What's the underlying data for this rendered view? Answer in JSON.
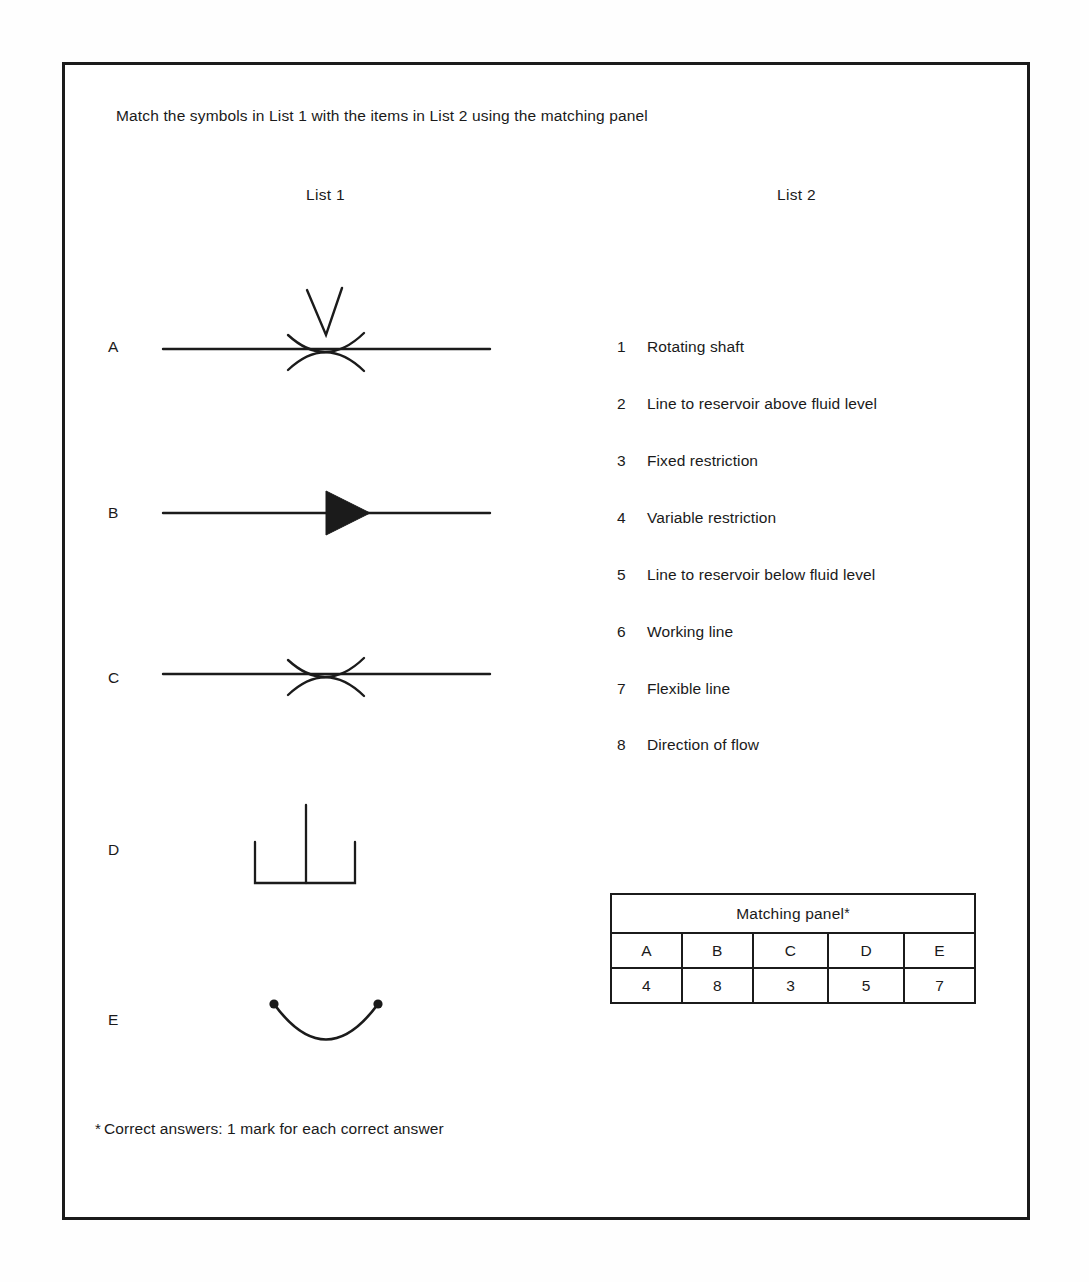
{
  "page": {
    "instruction": "Match the symbols in List 1 with the items in List 2 using the matching panel",
    "footnote_marker": "*",
    "footnote": "Correct answers: 1 mark for each correct answer",
    "ink_color": "#1b1b1b",
    "background_color": "#ffffff"
  },
  "list1": {
    "header": "List 1",
    "symbols": [
      {
        "letter": "A",
        "icon": "variable-restriction-symbol",
        "description": "horizontal line with opposing arcs forming a restriction, chevron arrow above"
      },
      {
        "letter": "B",
        "icon": "direction-of-flow-symbol",
        "description": "horizontal line with solid filled triangle pointing right"
      },
      {
        "letter": "C",
        "icon": "fixed-restriction-symbol",
        "description": "horizontal line with opposing arcs forming a restriction"
      },
      {
        "letter": "D",
        "icon": "reservoir-below-fluid-level-symbol",
        "description": "open-top reservoir with vertical line reaching the base"
      },
      {
        "letter": "E",
        "icon": "flexible-line-symbol",
        "description": "downward curved line with filled dots at both ends"
      }
    ]
  },
  "list2": {
    "header": "List 2",
    "items": [
      {
        "number": "1",
        "text": "Rotating shaft"
      },
      {
        "number": "2",
        "text": "Line to reservoir above fluid level"
      },
      {
        "number": "3",
        "text": "Fixed restriction"
      },
      {
        "number": "4",
        "text": "Variable restriction"
      },
      {
        "number": "5",
        "text": "Line to reservoir below fluid level"
      },
      {
        "number": "6",
        "text": "Working line"
      },
      {
        "number": "7",
        "text": "Flexible line"
      },
      {
        "number": "8",
        "text": "Direction of flow"
      }
    ]
  },
  "matching_panel": {
    "title": "Matching panel",
    "title_marker": "*",
    "headers": [
      "A",
      "B",
      "C",
      "D",
      "E"
    ],
    "answers": [
      "4",
      "8",
      "3",
      "5",
      "7"
    ]
  }
}
